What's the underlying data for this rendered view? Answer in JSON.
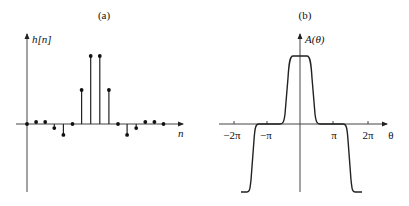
{
  "panel_a": {
    "title": "(a)",
    "ylabel": "h[n]",
    "xlabel": "n"
  },
  "panel_b": {
    "title": "(b)",
    "ylabel": "A(θ)",
    "xlabel": "θ",
    "ticks": [
      "−2π",
      "−π",
      "π",
      "2π"
    ]
  },
  "chart_data": [
    {
      "type": "stem",
      "title": "(a)",
      "xlabel": "n",
      "ylabel": "h[n]",
      "x": [
        0,
        1,
        2,
        3,
        4,
        5,
        6,
        7,
        8,
        9,
        10,
        11,
        12,
        13,
        14,
        15
      ],
      "values": [
        0,
        0.03,
        0.03,
        -0.06,
        -0.16,
        0,
        0.5,
        1.0,
        1.0,
        0.5,
        0,
        -0.16,
        -0.06,
        0.03,
        0.03,
        0
      ],
      "grid": false
    },
    {
      "type": "line",
      "title": "(b)",
      "xlabel": "θ",
      "ylabel": "A(θ)",
      "x_ticks": [
        "−2π",
        "−π",
        "π",
        "2π"
      ],
      "x": [
        -2.4,
        -2.2,
        -2.05,
        -1.95,
        -1.8,
        -1.0,
        -0.6,
        -0.5,
        -0.35,
        -0.25,
        -0.1,
        0,
        0.1,
        0.25,
        0.35,
        0.5,
        0.6,
        1.0,
        1.8,
        1.95,
        2.05,
        2.2,
        2.4
      ],
      "x_units": "π",
      "values": [
        -1,
        -1,
        -0.8,
        0,
        0,
        0,
        0,
        0.2,
        0.8,
        1,
        1,
        1,
        1,
        1,
        0.8,
        0.2,
        0,
        0,
        0,
        0,
        -0.8,
        -1,
        -1
      ],
      "xlim": [
        -2.4,
        2.5
      ],
      "ylim": [
        -1,
        1.4
      ],
      "grid": false
    }
  ]
}
